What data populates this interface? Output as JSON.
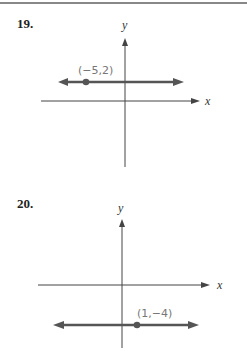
{
  "problems": [
    {
      "number": "19.",
      "point_label": "(−5,2)",
      "x_axis": "x",
      "y_axis": "y",
      "point": [
        -5,
        2
      ]
    },
    {
      "number": "20.",
      "point_label": "(1,−4)",
      "x_axis": "x",
      "y_axis": "y",
      "point": [
        1,
        -4
      ]
    }
  ],
  "colors": {
    "line": "#555555",
    "axis": "#444444",
    "label": "#777777"
  }
}
